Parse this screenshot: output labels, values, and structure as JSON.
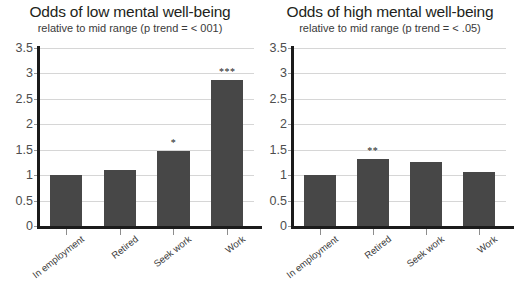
{
  "chart_data": [
    {
      "type": "bar",
      "panel": "left",
      "title": "Odds of low mental well-being",
      "subtitle": "relative to mid range (p trend = < 001)",
      "categories": [
        "In employment",
        "Retired",
        "Seek work",
        "Work"
      ],
      "values": [
        1.0,
        1.11,
        1.47,
        2.87
      ],
      "annotations": [
        "",
        "",
        "*",
        "***"
      ],
      "xlabel": "",
      "ylabel": "",
      "ylim": [
        0,
        3.5
      ],
      "yticks": [
        "0",
        "0.5",
        "1",
        "1.5",
        "2",
        "2.5",
        "3",
        "3.5"
      ],
      "ytick_values": [
        0,
        0.5,
        1,
        1.5,
        2,
        2.5,
        3,
        3.5
      ],
      "grid": true,
      "legend": "none",
      "bar_color": "#474747"
    },
    {
      "type": "bar",
      "panel": "right",
      "title": "Odds of high mental well-being",
      "subtitle": "relative to mid range (p trend = < .05)",
      "categories": [
        "In employment",
        "Retired",
        "Seek work",
        "Work"
      ],
      "values": [
        1.0,
        1.32,
        1.26,
        1.06
      ],
      "annotations": [
        "",
        "**",
        "",
        ""
      ],
      "xlabel": "",
      "ylabel": "",
      "ylim": [
        0,
        3.5
      ],
      "yticks": [
        "0",
        "0.5",
        "1",
        "1.5",
        "2",
        "2.5",
        "3",
        "3.5"
      ],
      "ytick_values": [
        0,
        0.5,
        1,
        1.5,
        2,
        2.5,
        3,
        3.5
      ],
      "grid": true,
      "legend": "none",
      "bar_color": "#474747"
    }
  ]
}
